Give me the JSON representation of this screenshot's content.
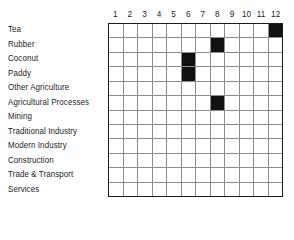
{
  "chart_data": {
    "type": "heatmap",
    "title": "",
    "xlabel": "",
    "ylabel": "",
    "legend": [],
    "grid": true,
    "n_rows": 12,
    "n_cols": 12,
    "categories": [
      "1",
      "2",
      "3",
      "4",
      "5",
      "6",
      "7",
      "8",
      "9",
      "10",
      "11",
      "12"
    ],
    "row_labels": [
      "Tea",
      "Rubber",
      "Coconut",
      "Paddy",
      "Other Agriculture",
      "Agricultural Processes",
      "Mining",
      "Traditional Industry",
      "Modern Industry",
      "Construction",
      "Trade & Transport",
      "Services"
    ],
    "filled_color": "#111111",
    "empty_color": "#ffffff",
    "grid_line_color": "#8d8d8d",
    "border_color": "#1b1b1b",
    "filled_cells": [
      {
        "row": "Tea",
        "row_index": 0,
        "col": "12",
        "col_index": 11
      },
      {
        "row": "Rubber",
        "row_index": 1,
        "col": "8",
        "col_index": 7
      },
      {
        "row": "Coconut",
        "row_index": 2,
        "col": "6",
        "col_index": 5
      },
      {
        "row": "Paddy",
        "row_index": 3,
        "col": "6",
        "col_index": 5
      },
      {
        "row": "Agricultural Processes",
        "row_index": 5,
        "col": "8",
        "col_index": 7
      }
    ],
    "values": [
      [
        0,
        0,
        0,
        0,
        0,
        0,
        0,
        0,
        0,
        0,
        0,
        1
      ],
      [
        0,
        0,
        0,
        0,
        0,
        0,
        0,
        1,
        0,
        0,
        0,
        0
      ],
      [
        0,
        0,
        0,
        0,
        0,
        1,
        0,
        0,
        0,
        0,
        0,
        0
      ],
      [
        0,
        0,
        0,
        0,
        0,
        1,
        0,
        0,
        0,
        0,
        0,
        0
      ],
      [
        0,
        0,
        0,
        0,
        0,
        0,
        0,
        0,
        0,
        0,
        0,
        0
      ],
      [
        0,
        0,
        0,
        0,
        0,
        0,
        0,
        1,
        0,
        0,
        0,
        0
      ],
      [
        0,
        0,
        0,
        0,
        0,
        0,
        0,
        0,
        0,
        0,
        0,
        0
      ],
      [
        0,
        0,
        0,
        0,
        0,
        0,
        0,
        0,
        0,
        0,
        0,
        0
      ],
      [
        0,
        0,
        0,
        0,
        0,
        0,
        0,
        0,
        0,
        0,
        0,
        0
      ],
      [
        0,
        0,
        0,
        0,
        0,
        0,
        0,
        0,
        0,
        0,
        0,
        0
      ],
      [
        0,
        0,
        0,
        0,
        0,
        0,
        0,
        0,
        0,
        0,
        0,
        0
      ],
      [
        0,
        0,
        0,
        0,
        0,
        0,
        0,
        0,
        0,
        0,
        0,
        0
      ]
    ]
  }
}
